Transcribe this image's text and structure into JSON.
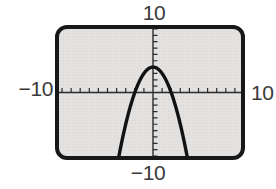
{
  "figure": {
    "colors": {
      "page_bg": "#ffffff",
      "screen_bg": "#e3e2e0",
      "screen_border": "#181818",
      "axis": "#2b2b2b",
      "curve": "#121212",
      "label": "#3a3a3a"
    }
  },
  "chart_data": {
    "type": "line",
    "title": "",
    "xlabel": "",
    "ylabel": "",
    "grid": false,
    "legend": false,
    "window": {
      "xmin": -10,
      "xmax": 10,
      "xscl": 1,
      "ymin": -10,
      "ymax": 10,
      "yscl": 1
    },
    "axis_labels": {
      "top": "10",
      "bottom": "−10",
      "left": "−10",
      "right": "10"
    },
    "series": [
      {
        "name": "parabola",
        "equation": "y = 4 − x²",
        "coefficients": {
          "a": -1,
          "b": 0,
          "c": 4
        },
        "vertex": [
          0,
          4
        ],
        "x_intercepts": [
          -2,
          2
        ],
        "y_intercept": 4,
        "x_range_drawn": [
          -3.9,
          3.9
        ]
      }
    ]
  }
}
